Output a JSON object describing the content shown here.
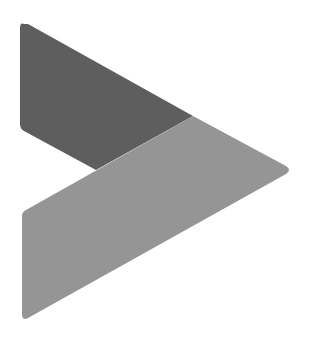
{
  "logo": {
    "name": "play-arrow-logo",
    "colors": {
      "background": "#ffffff",
      "upper_shape": "#5e5e5e",
      "lower_shape": "#959595"
    }
  }
}
